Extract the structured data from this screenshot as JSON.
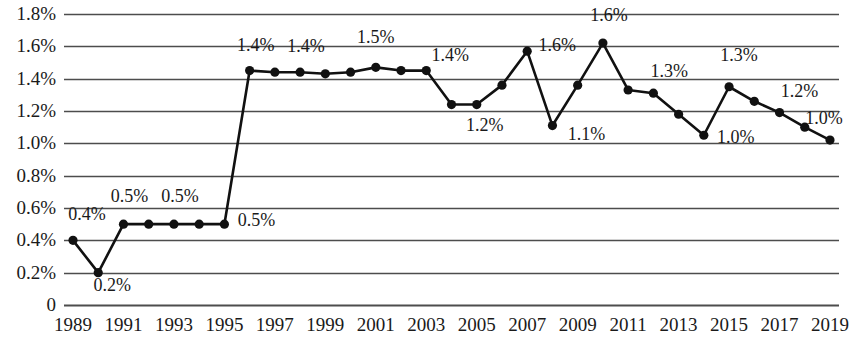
{
  "chart_data": {
    "type": "line",
    "title": "",
    "subtitle": "",
    "xlabel": "",
    "ylabel": "",
    "xlim": [
      1989,
      2019
    ],
    "ylim": [
      0,
      1.8
    ],
    "grid": true,
    "legend": null,
    "series_color": "#111111",
    "axis_color": "#4d4d4d",
    "marker": "circle",
    "x": [
      1989,
      1990,
      1991,
      1992,
      1993,
      1994,
      1995,
      1996,
      1997,
      1998,
      1999,
      2000,
      2001,
      2002,
      2003,
      2004,
      2005,
      2006,
      2007,
      2008,
      2009,
      2010,
      2011,
      2012,
      2013,
      2014,
      2015,
      2016,
      2017,
      2018,
      2019
    ],
    "values": [
      0.4,
      0.2,
      0.5,
      0.5,
      0.5,
      0.5,
      0.5,
      1.45,
      1.44,
      1.44,
      1.43,
      1.44,
      1.47,
      1.45,
      1.45,
      1.24,
      1.24,
      1.36,
      1.57,
      1.11,
      1.36,
      1.62,
      1.33,
      1.31,
      1.18,
      1.05,
      1.35,
      1.26,
      1.19,
      1.1,
      1.02
    ],
    "ytick_labels": [
      "1.8%",
      "1.6%",
      "1.4%",
      "1.2%",
      "1.0%",
      "0.8%",
      "0.6%",
      "0.4%",
      "0.2%",
      "0"
    ],
    "ytick_values": [
      1.8,
      1.6,
      1.4,
      1.2,
      1.0,
      0.8,
      0.6,
      0.4,
      0.2,
      0
    ],
    "xtick_labels": [
      "1989",
      "1991",
      "1993",
      "1995",
      "1997",
      "1999",
      "2001",
      "2003",
      "2005",
      "2007",
      "2009",
      "2011",
      "2013",
      "2015",
      "2017",
      "2019"
    ],
    "xtick_values": [
      1989,
      1991,
      1993,
      1995,
      1997,
      1999,
      2001,
      2003,
      2005,
      2007,
      2009,
      2011,
      2013,
      2015,
      2017,
      2019
    ],
    "point_labels": [
      {
        "text": "0.4%",
        "year": 1989,
        "value": 0.4,
        "dx": 14,
        "dy": -26
      },
      {
        "text": "0.2%",
        "year": 1990,
        "value": 0.2,
        "dx": 14,
        "dy": 12
      },
      {
        "text": "0.5%",
        "year": 1991,
        "value": 0.5,
        "dx": 6,
        "dy": -28
      },
      {
        "text": "0.5%",
        "year": 1993,
        "value": 0.5,
        "dx": 6,
        "dy": -28
      },
      {
        "text": "0.5%",
        "year": 1995,
        "value": 0.5,
        "dx": 32,
        "dy": -4
      },
      {
        "text": "1.4%",
        "year": 1996,
        "value": 1.45,
        "dx": 6,
        "dy": -26
      },
      {
        "text": "1.4%",
        "year": 1998,
        "value": 1.44,
        "dx": 6,
        "dy": -26
      },
      {
        "text": "1.5%",
        "year": 2001,
        "value": 1.47,
        "dx": 0,
        "dy": -30
      },
      {
        "text": "1.4%",
        "year": 2003,
        "value": 1.45,
        "dx": 24,
        "dy": -16
      },
      {
        "text": "1.2%",
        "year": 2005,
        "value": 1.24,
        "dx": 8,
        "dy": 20
      },
      {
        "text": "1.6%",
        "year": 2007,
        "value": 1.57,
        "dx": 30,
        "dy": -6
      },
      {
        "text": "1.1%",
        "year": 2008,
        "value": 1.11,
        "dx": 34,
        "dy": 8
      },
      {
        "text": "1.6%",
        "year": 2010,
        "value": 1.62,
        "dx": 6,
        "dy": -28
      },
      {
        "text": "1.3%",
        "year": 2012,
        "value": 1.31,
        "dx": 16,
        "dy": -22
      },
      {
        "text": "1.0%",
        "year": 2014,
        "value": 1.05,
        "dx": 32,
        "dy": 2
      },
      {
        "text": "1.3%",
        "year": 2015,
        "value": 1.35,
        "dx": 10,
        "dy": -32
      },
      {
        "text": "1.2%",
        "year": 2017,
        "value": 1.19,
        "dx": 20,
        "dy": -22
      },
      {
        "text": "1.0%",
        "year": 2019,
        "value": 1.02,
        "dx": -6,
        "dy": -22
      }
    ]
  }
}
